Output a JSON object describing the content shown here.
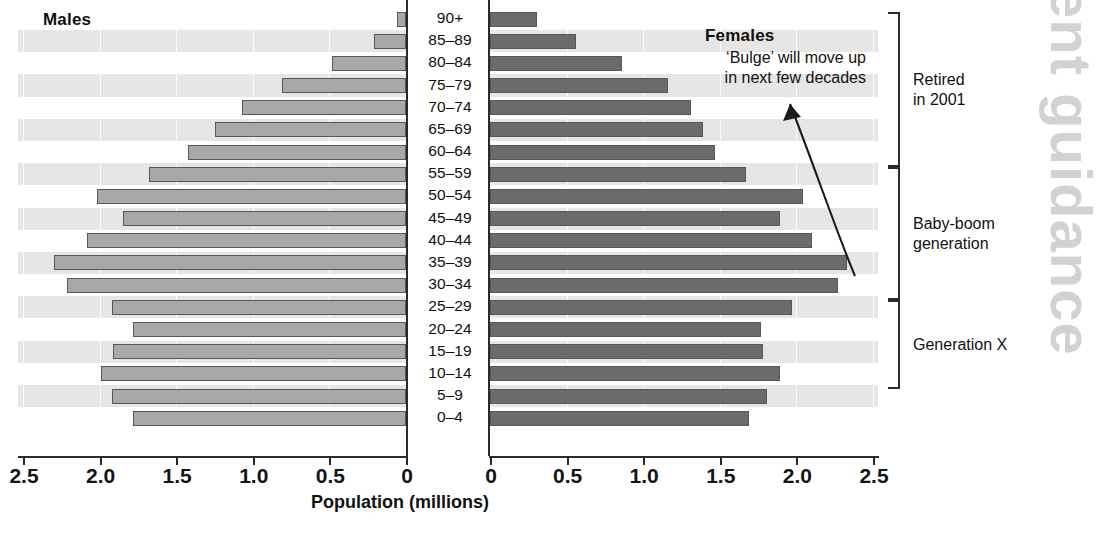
{
  "watermark_text": "ent guidance",
  "headings": {
    "males": "Males",
    "females": "Females"
  },
  "annotation": {
    "bulge_line1": "‘Bulge’ will move up",
    "bulge_line2": "in next few decades"
  },
  "axis_title": "Population (millions)",
  "brackets": [
    {
      "label_line1": "Retired",
      "label_line2": "in 2001"
    },
    {
      "label_line1": "Baby-boom",
      "label_line2": "generation"
    },
    {
      "label_line1": "Generation X",
      "label_line2": ""
    }
  ],
  "colors": {
    "male_bar": "#a7a8aa",
    "female_bar": "#6a6b6d",
    "bar_outline": "#57585a",
    "band": "#e6e6e6",
    "axis": "#2a2a2a",
    "watermark": "#d2d2d2"
  },
  "chart_data": {
    "type": "bar",
    "title": "",
    "subtitle": "",
    "xlabel": "Population (millions)",
    "ylabel": "",
    "orientation": "horizontal",
    "layout": "population-pyramid",
    "grid": true,
    "legend_position": "inside-top-corners",
    "categories": [
      "90+",
      "85–89",
      "80–84",
      "75–79",
      "70–74",
      "65–69",
      "60–64",
      "55–59",
      "50–54",
      "45–49",
      "40–44",
      "35–39",
      "30–34",
      "25–29",
      "20–24",
      "15–19",
      "10–14",
      "5–9",
      "0–4"
    ],
    "left_axis": {
      "label": "Males",
      "ticks": [
        "2.5",
        "2.0",
        "1.5",
        "1.0",
        "0.5",
        "0"
      ],
      "tick_values": [
        2.5,
        2.0,
        1.5,
        1.0,
        0.5,
        0
      ],
      "xlim": [
        2.5,
        0
      ],
      "direction": "right-to-left"
    },
    "right_axis": {
      "label": "Females",
      "ticks": [
        "0",
        "0.5",
        "1.0",
        "1.5",
        "2.0",
        "2.5"
      ],
      "tick_values": [
        0,
        0.5,
        1.0,
        1.5,
        2.0,
        2.5
      ],
      "xlim": [
        0,
        2.5
      ],
      "direction": "left-to-right"
    },
    "series": [
      {
        "name": "Males",
        "side": "left",
        "color": "#a7a8aa",
        "values": [
          0.06,
          0.21,
          0.48,
          0.81,
          1.07,
          1.25,
          1.42,
          1.68,
          2.02,
          1.85,
          2.08,
          2.3,
          2.21,
          1.92,
          1.78,
          1.91,
          1.99,
          1.92,
          1.78
        ]
      },
      {
        "name": "Females",
        "side": "right",
        "color": "#6a6b6d",
        "values": [
          0.31,
          0.56,
          0.86,
          1.16,
          1.31,
          1.39,
          1.47,
          1.67,
          2.04,
          1.89,
          2.1,
          2.33,
          2.27,
          1.97,
          1.77,
          1.78,
          1.89,
          1.81,
          1.69
        ]
      }
    ],
    "annotations": [
      {
        "text": "‘Bulge’ will move up in next few decades",
        "arrow_from_category": "35–39",
        "arrow_to_category": "75–79"
      }
    ],
    "category_groups": [
      {
        "label": "Retired in 2001",
        "categories": [
          "90+",
          "85–89",
          "80–84",
          "75–79",
          "70–74",
          "65–69",
          "60–64"
        ]
      },
      {
        "label": "Baby-boom generation",
        "categories": [
          "55–59",
          "50–54",
          "45–49",
          "40–44",
          "35–39",
          "30–34"
        ]
      },
      {
        "label": "Generation X",
        "categories": [
          "25–29",
          "20–24",
          "15–19",
          "10–14"
        ]
      }
    ]
  }
}
